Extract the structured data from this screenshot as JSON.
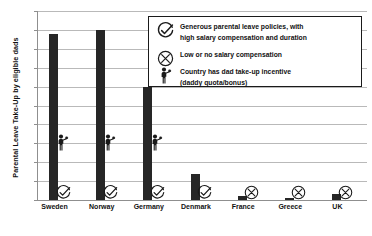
{
  "chart_data": {
    "type": "bar",
    "title": "",
    "xlabel": "",
    "ylabel": "Parental Leave Take-Up by eligible dads",
    "ylim": [
      0,
      100
    ],
    "ytick_labels": [
      "0%",
      "10%",
      "20%",
      "30%",
      "40%",
      "50%",
      "60%",
      "70%",
      "80%",
      "90%",
      "100%"
    ],
    "ytick_values": [
      0,
      10,
      20,
      30,
      40,
      50,
      60,
      70,
      80,
      90,
      100
    ],
    "grid": true,
    "legend_position": "upper-right-inside",
    "categories": [
      "Sweden",
      "Norway",
      "Germany",
      "Denmark",
      "France",
      "Greece",
      "UK"
    ],
    "values": [
      88,
      90,
      60,
      14,
      2,
      1,
      3
    ],
    "unit": "%",
    "series": [
      {
        "name": "Parental Leave Take-Up by eligible dads",
        "values": [
          88,
          90,
          60,
          14,
          2,
          1,
          3
        ],
        "color": "#262626"
      }
    ],
    "annotations": [
      {
        "category": "Sweden",
        "marker": "check",
        "note": "Generous parental leave policies, with high salary compensation and duration"
      },
      {
        "category": "Norway",
        "marker": "check",
        "note": "Generous parental leave policies, with high salary compensation and duration"
      },
      {
        "category": "Germany",
        "marker": "check",
        "note": "Generous parental leave policies, with high salary compensation and duration"
      },
      {
        "category": "Denmark",
        "marker": "check",
        "note": "Generous parental leave policies, with high salary compensation and duration"
      },
      {
        "category": "France",
        "marker": "cross",
        "note": "Low or no salary compensation"
      },
      {
        "category": "Greece",
        "marker": "cross",
        "note": "Low or no salary compensation"
      },
      {
        "category": "UK",
        "marker": "cross",
        "note": "Low or no salary compensation"
      },
      {
        "category": "Sweden",
        "marker": "dad-figure",
        "note": "Country has dad take-up incentive (daddy quota/bonus)"
      },
      {
        "category": "Norway",
        "marker": "dad-figure",
        "note": "Country has dad take-up incentive (daddy quota/bonus)"
      },
      {
        "category": "Germany",
        "marker": "dad-figure",
        "note": "Country has dad take-up incentive (daddy quota/bonus)"
      }
    ]
  },
  "axis": {
    "y_title": "Parental Leave Take-Up by eligible dads",
    "y_ticks": [
      "100%",
      "90%",
      "80%",
      "70%",
      "60%",
      "50%",
      "40%",
      "30%",
      "20%",
      "10%",
      "0%"
    ],
    "x_ticks": [
      "Sweden",
      "Norway",
      "Germany",
      "Denmark",
      "France",
      "Greece",
      "UK"
    ]
  },
  "legend": {
    "items": [
      {
        "icon": "check-circle-icon",
        "line1": "Generous parental leave policies, with",
        "line2": "high salary compensation and duration"
      },
      {
        "icon": "cross-circle-icon",
        "line1": "Low or no salary compensation",
        "line2": ""
      },
      {
        "icon": "dad-figure-icon",
        "line1": "Country has dad take-up incentive",
        "line2": "(daddy quota/bonus)"
      }
    ]
  },
  "colors": {
    "bar": "#262626",
    "grid": "#b9b9b9",
    "axis": "#8f8f8f",
    "text": "#111111",
    "legend_border": "#1a1a1a",
    "background": "#ffffff"
  }
}
